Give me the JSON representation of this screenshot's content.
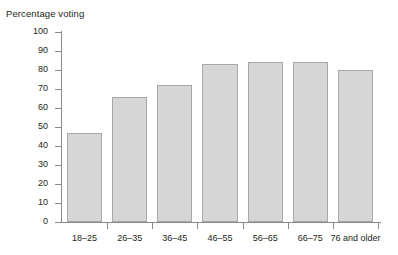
{
  "chart_data": {
    "type": "bar",
    "title": "Percentage voting",
    "xlabel": "",
    "ylabel": "Percentage voting",
    "categories": [
      "18–25",
      "26–35",
      "36–45",
      "46–55",
      "56–65",
      "66–75",
      "76 and older"
    ],
    "values": [
      47,
      66,
      72,
      83,
      84,
      84,
      80
    ],
    "ylim": [
      0,
      100
    ],
    "yticks": [
      0,
      10,
      20,
      30,
      40,
      50,
      60,
      70,
      80,
      90,
      100
    ],
    "ytick_labels": [
      "0",
      "10",
      "20",
      "30",
      "40",
      "50",
      "60",
      "70",
      "80",
      "90",
      "100"
    ],
    "grid": false,
    "legend": false,
    "bar_color": "#d6d6d6",
    "bar_border_color": "#a8a8a8",
    "axis_color": "#8a8a8a",
    "text_color": "#231f20",
    "background": "#ffffff"
  }
}
